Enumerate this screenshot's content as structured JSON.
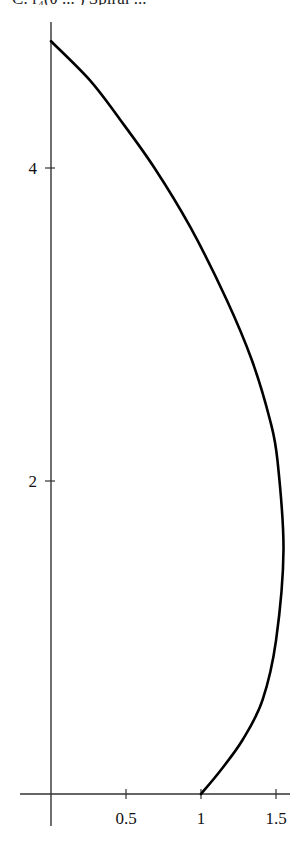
{
  "caption": "C: r₄(θ ... ) Spiral ...",
  "chart_data": {
    "type": "line",
    "title": "",
    "xlabel": "",
    "ylabel": "",
    "xlim": [
      -0.2,
      1.6
    ],
    "ylim": [
      -0.3,
      5.0
    ],
    "grid": false,
    "legend": null,
    "x_ticks": [
      0.5,
      1,
      1.5
    ],
    "x_tick_labels": [
      "0.5",
      "1",
      "1.5"
    ],
    "y_ticks": [
      2,
      4
    ],
    "y_tick_labels": [
      "2",
      "4"
    ],
    "series": [
      {
        "name": "curve",
        "color": "#000000",
        "x": [
          1.0,
          1.13,
          1.28,
          1.41,
          1.5,
          1.55,
          1.51,
          1.46,
          1.34,
          1.17,
          0.93,
          0.69,
          0.46,
          0.26,
          0.0
        ],
        "y": [
          0.0,
          0.15,
          0.35,
          0.6,
          0.98,
          1.56,
          2.13,
          2.39,
          2.77,
          3.16,
          3.62,
          4.0,
          4.31,
          4.56,
          4.81
        ]
      }
    ]
  },
  "plot": {
    "origin_px": [
      51,
      794
    ],
    "px_per_unit_x": 150,
    "px_per_unit_y": 156.5,
    "x_axis_px": [
      20,
      290
    ],
    "y_axis_px": [
      22,
      826
    ]
  }
}
